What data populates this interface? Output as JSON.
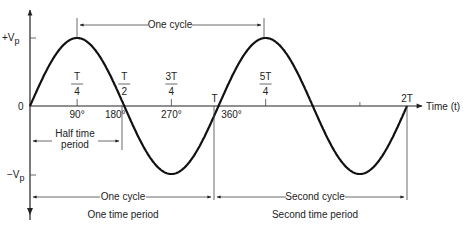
{
  "diagram": {
    "type": "sine-wave-period",
    "y_axis": {
      "pos_peak_label": "+V",
      "pos_peak_sub": "p",
      "zero_label": "0",
      "neg_peak_label": "−V",
      "neg_peak_sub": "p"
    },
    "x_axis": {
      "label": "Time (t)"
    },
    "time_ticks": [
      {
        "num": "T",
        "den": "4",
        "frac_of_T": 0.25
      },
      {
        "num": "T",
        "den": "2",
        "frac_of_T": 0.5
      },
      {
        "num": "3T",
        "den": "4",
        "frac_of_T": 0.75
      },
      {
        "num": "T",
        "den": "",
        "frac_of_T": 1.0
      },
      {
        "num": "5T",
        "den": "4",
        "frac_of_T": 1.25
      },
      {
        "num": "2T",
        "den": "",
        "frac_of_T": 2.0
      }
    ],
    "degree_ticks": [
      {
        "label": "90°",
        "deg": 90
      },
      {
        "label": "180°",
        "deg": 180
      },
      {
        "label": "270°",
        "deg": 270
      },
      {
        "label": "360°",
        "deg": 360
      }
    ],
    "cycles_shown": 2,
    "annotations": {
      "top_cycle": "One cycle",
      "half_period_line1": "Half time",
      "half_period_line2": "period",
      "first_cycle": "One cycle",
      "first_period": "One time period",
      "second_cycle": "Second cycle",
      "second_period": "Second time period"
    }
  }
}
